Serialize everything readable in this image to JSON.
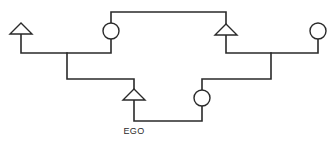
{
  "diagram": {
    "type": "kinship-chart",
    "legend": {
      "triangle": "male",
      "circle": "female"
    },
    "line_color": "#2a2a2a",
    "background": "#ffffff",
    "ego_label": "EGO",
    "nodes": [
      {
        "id": "paternal-grandfather",
        "shape": "triangle",
        "x": 21,
        "y": 29
      },
      {
        "id": "paternal-grandmother",
        "shape": "circle",
        "x": 111,
        "y": 31
      },
      {
        "id": "ego",
        "shape": "triangle",
        "x": 134,
        "y": 95,
        "label": "EGO"
      },
      {
        "id": "spouse",
        "shape": "circle",
        "x": 202,
        "y": 98
      },
      {
        "id": "maternal-grandfather",
        "shape": "triangle",
        "x": 226,
        "y": 30
      },
      {
        "id": "maternal-grandmother",
        "shape": "circle",
        "x": 318,
        "y": 31
      }
    ],
    "edges": [
      {
        "from": "paternal-grandfather",
        "to": "paternal-grandmother",
        "kind": "marriage"
      },
      {
        "from": "maternal-grandfather",
        "to": "maternal-grandmother",
        "kind": "marriage"
      },
      {
        "from": "paternal-grandmother",
        "to": "maternal-grandfather",
        "kind": "sibling-link"
      },
      {
        "from": "paternal-couple",
        "to": "ego",
        "kind": "descent"
      },
      {
        "from": "maternal-couple",
        "to": "spouse",
        "kind": "descent"
      },
      {
        "from": "ego",
        "to": "spouse",
        "kind": "marriage"
      }
    ]
  }
}
